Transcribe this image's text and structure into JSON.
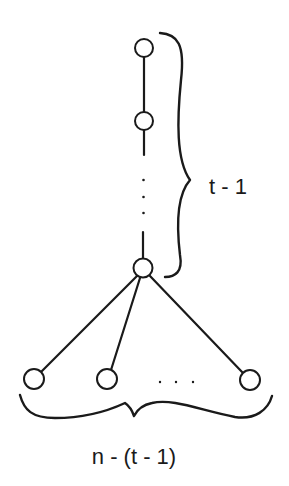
{
  "diagram": {
    "type": "graph",
    "labels": {
      "path_count": "t - 1",
      "leaf_count": "n - (t - 1)"
    },
    "ellipsis": {
      "vertical": "⋮",
      "horizontal": ". . ."
    },
    "nodes": [
      {
        "id": "path-1",
        "cx": 144,
        "cy": 48
      },
      {
        "id": "path-2",
        "cx": 144,
        "cy": 121
      },
      {
        "id": "hub",
        "cx": 143,
        "cy": 268
      },
      {
        "id": "leaf-1",
        "cx": 34,
        "cy": 379
      },
      {
        "id": "leaf-2",
        "cx": 107,
        "cy": 379
      },
      {
        "id": "leaf-last",
        "cx": 250,
        "cy": 380
      }
    ],
    "colors": {
      "stroke": "#1a1a1a",
      "background": "#ffffff"
    }
  }
}
